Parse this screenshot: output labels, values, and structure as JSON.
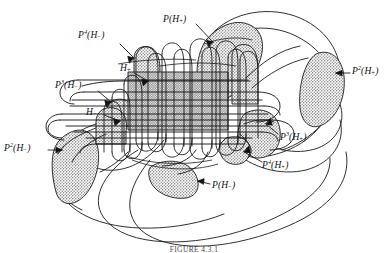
{
  "figure": {
    "caption": "FIGURE 4.3.1",
    "background_color": "#ffffff",
    "ink_color": "#111111",
    "fill_color": "#b9b9b9",
    "labels": [
      {
        "id": "p4-h-minus",
        "math": "P",
        "exponent": "4",
        "arg_base": "H",
        "arg_sub": "−",
        "text": "P⁴(H−)",
        "x": 78,
        "y": 36
      },
      {
        "id": "p-h-plus",
        "math": "P",
        "exponent": "",
        "arg_base": "H",
        "arg_sub": "+",
        "text": "P(H+)",
        "x": 163,
        "y": 20
      },
      {
        "id": "h-plus",
        "math": "H",
        "exponent": "",
        "arg_base": "",
        "arg_sub": "+",
        "text": "H+",
        "x": 120,
        "y": 69
      },
      {
        "id": "p3-h-minus",
        "math": "P",
        "exponent": "3",
        "arg_base": "H",
        "arg_sub": "−",
        "text": "P³(H−)",
        "x": 60,
        "y": 86
      },
      {
        "id": "h-minus",
        "math": "H",
        "exponent": "",
        "arg_base": "",
        "arg_sub": "−",
        "text": "H−",
        "x": 88,
        "y": 113
      },
      {
        "id": "p2-h-minus",
        "math": "P",
        "exponent": "2",
        "arg_base": "H",
        "arg_sub": "−",
        "text": "P²(H−)",
        "x": 7,
        "y": 148
      },
      {
        "id": "p2-h-plus",
        "math": "P",
        "exponent": "2",
        "arg_base": "H",
        "arg_sub": "+",
        "text": "P²(H+)",
        "x": 352,
        "y": 70
      },
      {
        "id": "p3-h-plus",
        "math": "P",
        "exponent": "3",
        "arg_base": "H",
        "arg_sub": "+",
        "text": "P³(H+)",
        "x": 280,
        "y": 138
      },
      {
        "id": "p4-h-plus",
        "math": "P",
        "exponent": "4",
        "arg_base": "H",
        "arg_sub": "+",
        "text": "P⁴(H+)",
        "x": 263,
        "y": 166
      },
      {
        "id": "p-h-minus",
        "math": "P",
        "exponent": "",
        "arg_base": "H",
        "arg_sub": "−",
        "text": "P(H−)",
        "x": 212,
        "y": 186
      }
    ]
  }
}
